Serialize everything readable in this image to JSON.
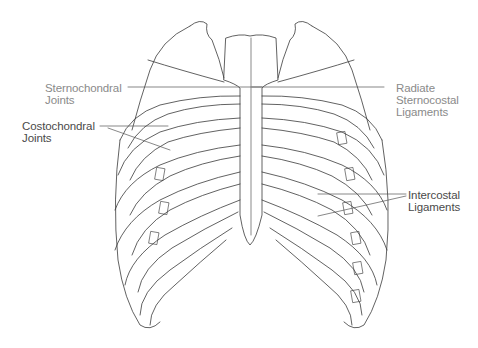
{
  "diagram": {
    "labels": [
      {
        "id": "sternochondral-joints",
        "line1": "Sternochondral",
        "line2": "Joints"
      },
      {
        "id": "costochondral-joints",
        "line1": "Costochondral",
        "line2": "Joints"
      },
      {
        "id": "radiate-sternocostal-ligaments",
        "line1": "Radiate",
        "line2": "Sternocostal",
        "line3": "Ligaments"
      },
      {
        "id": "intercostal-ligaments",
        "line1": "Intercostal",
        "line2": "Ligaments"
      }
    ],
    "colors": {
      "line": "#3a3a3a",
      "background": "#ffffff",
      "text": "#4a4a4a"
    }
  }
}
